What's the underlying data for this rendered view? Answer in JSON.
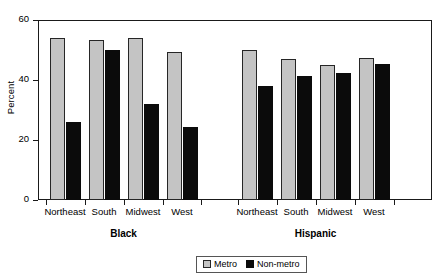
{
  "chart_data": {
    "type": "bar",
    "title": "",
    "xlabel": "",
    "ylabel": "Percent",
    "ylim": [
      0,
      60
    ],
    "yticks": [
      0,
      20,
      40,
      60
    ],
    "grid": false,
    "legend_position": "bottom-center",
    "groups": [
      {
        "name": "Black",
        "categories": [
          "Northeast",
          "South",
          "Midwest",
          "West"
        ]
      },
      {
        "name": "Hispanic",
        "categories": [
          "Northeast",
          "South",
          "Midwest",
          "West"
        ]
      }
    ],
    "categories": [
      "Black-Northeast",
      "Black-South",
      "Black-Midwest",
      "Black-West",
      "Hispanic-Northeast",
      "Hispanic-South",
      "Hispanic-Midwest",
      "Hispanic-West"
    ],
    "series": [
      {
        "name": "Metro",
        "color": "#c4c4c4",
        "values": [
          54,
          53.5,
          54,
          49.5,
          50,
          47,
          45,
          47.5
        ]
      },
      {
        "name": "Non-metro",
        "color": "#0b0b0b",
        "values": [
          26,
          50,
          32,
          24.5,
          38,
          41.5,
          42.5,
          45.5
        ]
      }
    ]
  },
  "legend": {
    "items": [
      {
        "label": "Metro",
        "swatch": "metro"
      },
      {
        "label": "Non-metro",
        "swatch": "nonmetro"
      }
    ]
  },
  "axis": {
    "y_title": "Percent",
    "y_tick_labels": [
      "0",
      "20",
      "40",
      "60"
    ]
  }
}
